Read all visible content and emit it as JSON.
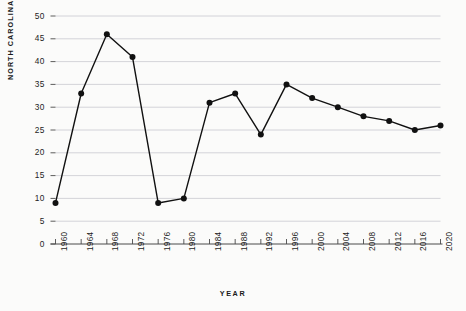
{
  "chart_data": {
    "type": "line",
    "title": "",
    "xlabel": "YEAR",
    "ylabel": "NORTH CAROLINA RANK",
    "categories": [
      "1960",
      "1964",
      "1968",
      "1972",
      "1976",
      "1980",
      "1984",
      "1988",
      "1992",
      "1996",
      "2000",
      "2004",
      "2008",
      "2012",
      "2016",
      "2020"
    ],
    "values": [
      9,
      33,
      46,
      41,
      9,
      10,
      31,
      33,
      24,
      35,
      32,
      30,
      28,
      27,
      25,
      26
    ],
    "x": [
      1960,
      1964,
      1968,
      1972,
      1976,
      1980,
      1984,
      1988,
      1992,
      1996,
      2000,
      2004,
      2008,
      2012,
      2016,
      2020
    ],
    "ylim": [
      0,
      50
    ],
    "xlim": [
      1960,
      2020
    ],
    "yticks": [
      0,
      5,
      10,
      15,
      20,
      25,
      30,
      35,
      40,
      45,
      50
    ],
    "ytick_labels": [
      "0",
      "5",
      "10",
      "15",
      "20",
      "25",
      "30",
      "35",
      "40",
      "45",
      "50"
    ],
    "xticks": [
      1960,
      1964,
      1968,
      1972,
      1976,
      1980,
      1984,
      1988,
      1992,
      1996,
      2000,
      2004,
      2008,
      2012,
      2016,
      2020
    ],
    "grid": true,
    "grid_axis": "y",
    "legend": false,
    "series_color": "#111111",
    "grid_color": "#c9c9cf",
    "axis_color": "#4a4a4a",
    "marker": "circle",
    "marker_size": 3.0,
    "line_width": 1.4,
    "background_color": "#fbfbfa"
  }
}
